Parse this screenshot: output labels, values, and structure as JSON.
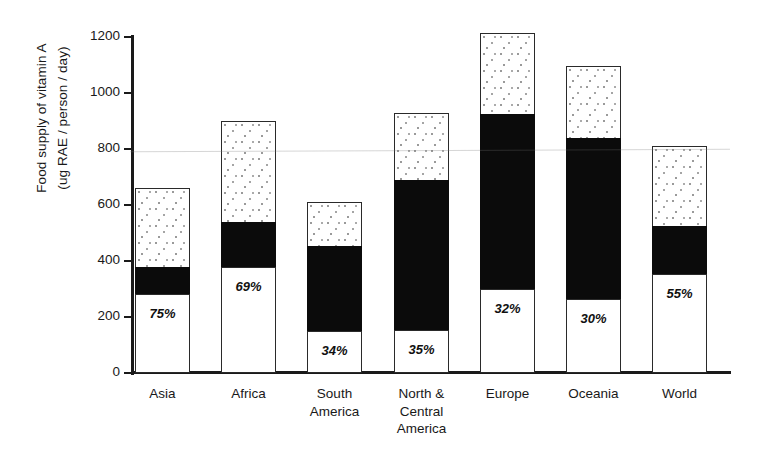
{
  "chart_data": {
    "type": "bar",
    "title": "",
    "subtitle": "",
    "xlabel": "",
    "ylabel_line1": "Food supply of vitamin A",
    "ylabel_line2": "(ug RAE / person / day)",
    "ylim": [
      0,
      1200
    ],
    "yticks": [
      0,
      200,
      400,
      600,
      800,
      1000,
      1200
    ],
    "ytick_labels": [
      "0",
      "200",
      "400",
      "600",
      "800",
      "1000",
      "1200"
    ],
    "grid": false,
    "legend": "none",
    "stacked": true,
    "categories": [
      "Asia",
      "Africa",
      "South America",
      "North & Central America",
      "Europe",
      "Oceania",
      "World"
    ],
    "category_label_lines": [
      [
        "Asia"
      ],
      [
        "Africa"
      ],
      [
        "South",
        "America"
      ],
      [
        "North &",
        "Central",
        "America"
      ],
      [
        "Europe"
      ],
      [
        "Oceania"
      ],
      [
        "World"
      ]
    ],
    "series": [
      {
        "name": "plant-source (white, lower)",
        "fill": "white",
        "values": [
          282,
          378,
          150,
          155,
          300,
          265,
          355
        ]
      },
      {
        "name": "animal-source (black, middle)",
        "fill": "black",
        "values": [
          96,
          162,
          302,
          535,
          625,
          575,
          170
        ]
      },
      {
        "name": "remaining (dotted, upper)",
        "fill": "dotted",
        "values": [
          282,
          360,
          158,
          240,
          290,
          255,
          285
        ]
      }
    ],
    "totals": [
      660,
      900,
      610,
      930,
      1215,
      1095,
      810
    ],
    "annotations": [
      {
        "category": "Asia",
        "text": "75%"
      },
      {
        "category": "Africa",
        "text": "69%"
      },
      {
        "category": "South America",
        "text": "34%"
      },
      {
        "category": "North & Central America",
        "text": "35%"
      },
      {
        "category": "Europe",
        "text": "32%"
      },
      {
        "category": "Oceania",
        "text": "30%"
      },
      {
        "category": "World",
        "text": "55%"
      }
    ],
    "annotation_values": [
      "75%",
      "69%",
      "34%",
      "35%",
      "32%",
      "30%",
      "55%"
    ],
    "colors": {
      "axis": "#1a1a1a",
      "black_segment": "#0b0b0b",
      "white_segment": "#ffffff",
      "dotted_segment": "#ffffff",
      "dot_color": "#9a9a9a",
      "text": "#191919"
    }
  }
}
